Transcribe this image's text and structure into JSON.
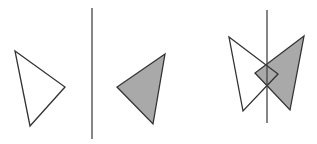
{
  "diagram": {
    "colors": {
      "stroke": "#333333",
      "fill_shaded": "#a9a9a9",
      "fill_unshaded": "#ffffff",
      "axis": "#444444"
    },
    "panel_left": {
      "original_triangle": [
        [
          15,
          51
        ],
        [
          65,
          87
        ],
        [
          30,
          126
        ]
      ],
      "mirror_line": [
        [
          92,
          8
        ],
        [
          92,
          139
        ]
      ],
      "reflected_triangle": [
        [
          165,
          54
        ],
        [
          117,
          87
        ],
        [
          153,
          124
        ]
      ]
    },
    "panel_right": {
      "mirror_line": [
        [
          267,
          10
        ],
        [
          267,
          123
        ]
      ],
      "original_triangle": [
        [
          229,
          37
        ],
        [
          278,
          74
        ],
        [
          243,
          111
        ]
      ],
      "reflected_triangle": [
        [
          304,
          36
        ],
        [
          255,
          73
        ],
        [
          290,
          110
        ]
      ]
    }
  }
}
